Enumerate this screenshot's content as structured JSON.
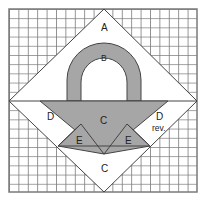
{
  "diagram": {
    "type": "quilt-block-pattern",
    "colors": {
      "background": "#ffffff",
      "grid_line": "#7a7a7a",
      "fabric_gray": "#a6a6a6",
      "fabric_white": "#ffffff",
      "outline": "#333333"
    },
    "pieces": {
      "A": "A",
      "B": "B",
      "C_top": "C",
      "C_bottom": "C",
      "D_left": "D",
      "D_right": "D",
      "D_right_note": "rev.",
      "E_left": "E",
      "E_right": "E"
    }
  }
}
